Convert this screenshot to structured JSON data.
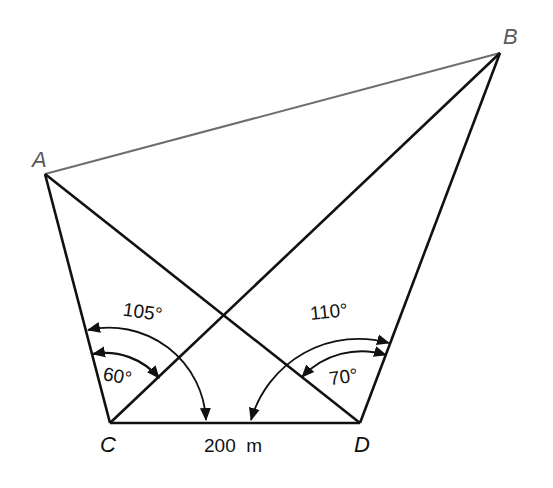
{
  "diagram": {
    "title": "",
    "points": {
      "A": {
        "label": "A",
        "x": 45,
        "y": 174
      },
      "B": {
        "label": "B",
        "x": 500,
        "y": 53
      },
      "C": {
        "label": "C",
        "x": 110,
        "y": 423
      },
      "D": {
        "label": "D",
        "x": 360,
        "y": 423
      }
    },
    "segments": [
      {
        "from": "A",
        "to": "B",
        "style": "thin-gray"
      },
      {
        "from": "A",
        "to": "C",
        "style": "bold"
      },
      {
        "from": "A",
        "to": "D",
        "style": "bold"
      },
      {
        "from": "B",
        "to": "C",
        "style": "bold"
      },
      {
        "from": "B",
        "to": "D",
        "style": "bold"
      },
      {
        "from": "C",
        "to": "D",
        "style": "bold"
      }
    ],
    "angles": {
      "ACD": {
        "label": "105°",
        "vertex": "C",
        "value_deg": 105
      },
      "ACB": {
        "label": "60°",
        "vertex": "C",
        "value_deg": 60
      },
      "BDC": {
        "label": "110°",
        "vertex": "D",
        "value_deg": 110
      },
      "BDA": {
        "label": "70°",
        "vertex": "D",
        "value_deg": 70
      }
    },
    "baseline": {
      "label": "200  m",
      "value": 200,
      "unit": "m"
    },
    "colors": {
      "line": "#111111",
      "ab_line": "#6e6e6e",
      "background": "#ffffff"
    }
  }
}
